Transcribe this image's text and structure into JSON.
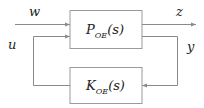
{
  "diagram": {
    "type": "feedback-block-diagram",
    "blocks": [
      {
        "id": "plant",
        "label": "P",
        "subscript": "OE",
        "arg": "(s)"
      },
      {
        "id": "controller",
        "label": "K",
        "subscript": "OE",
        "arg": "(s)"
      }
    ],
    "signals": {
      "w": "w",
      "z": "z",
      "u": "u",
      "y": "y"
    },
    "colors": {
      "line": "#8a8a8a",
      "box": "#9a9a9a",
      "text": "#222222"
    }
  }
}
